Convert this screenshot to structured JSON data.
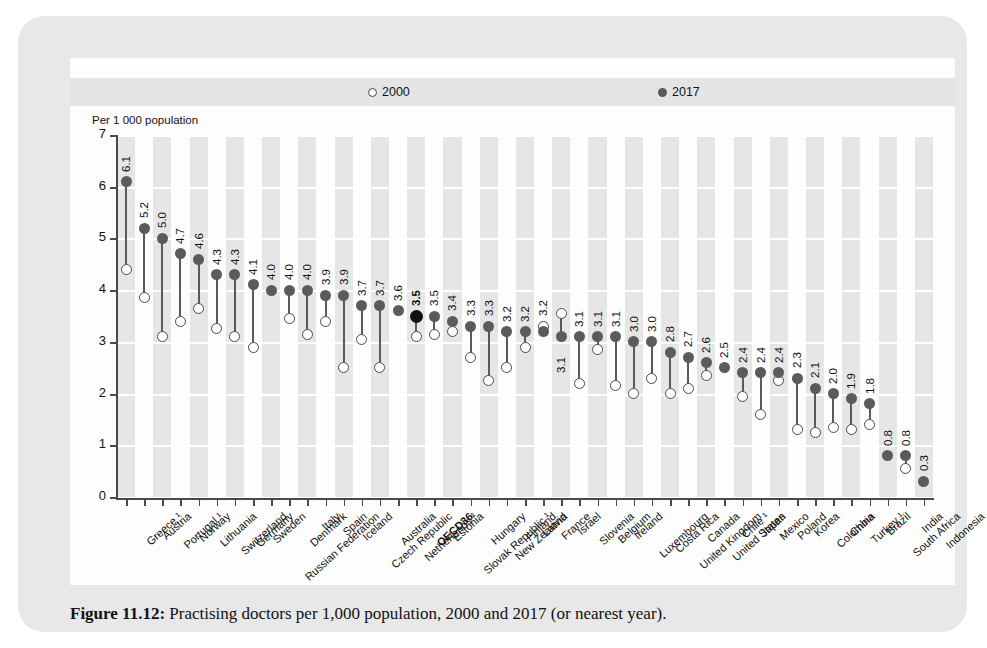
{
  "figure": {
    "caption_label": "Figure 11.12:",
    "caption_text": " Practising doctors per 1,000 population, 2000 and 2017 (or nearest year)."
  },
  "legend": {
    "series_2000": "2000",
    "series_2017": "2017",
    "marker_2000": "open-circle",
    "marker_2017": "filled-circle"
  },
  "axis": {
    "y_title": "Per 1 000 population",
    "y_ticks": [
      "0",
      "1",
      "2",
      "3",
      "4",
      "5",
      "6",
      "7"
    ]
  },
  "colors": {
    "panel": "#e8e8e8",
    "card": "#fdfdfd",
    "band": "#e6e6e6",
    "marker_2017": "#5b5b5b",
    "marker_2017_highlight": "#111111",
    "marker_2000_stroke": "#4a4a4a",
    "axis": "#4a4a4a",
    "gridline": "#ffffff"
  },
  "chart_data": {
    "type": "scatter",
    "title": "Practising doctors per 1,000 population, 2000 and 2017 (or nearest year).",
    "xlabel": "",
    "ylabel": "Per 1 000 population",
    "ylim": [
      0,
      7
    ],
    "grid": true,
    "legend_position": "top",
    "categories": [
      "Greece ¹",
      "Austria",
      "Portugal ¹",
      "Norway",
      "Lithuania",
      "Switzerland",
      "Germany",
      "Sweden",
      "Russian Federation",
      "Denmark",
      "Italy",
      "Spain",
      "Iceland",
      "Czech Republic",
      "Australia",
      "Netherlands ¹",
      "OECD36",
      "Estonia",
      "Slovak Republic ¹",
      "Hungary",
      "New Zealand",
      "Finland",
      "Latvia",
      "France",
      "Israel",
      "Slovenia",
      "Belgium",
      "Ireland",
      "Luxembourg",
      "Costa Rica",
      "United Kingdom",
      "Canada",
      "United States",
      "Chile ¹",
      "Japan",
      "Mexico",
      "Poland",
      "Korea",
      "Colombia",
      "China",
      "Turkey ¹",
      "Brazil",
      "South Africa",
      "India",
      "Indonesia"
    ],
    "series": [
      {
        "name": "2017",
        "marker": "filled-circle",
        "values": [
          6.1,
          5.2,
          5.0,
          4.7,
          4.6,
          4.3,
          4.3,
          4.1,
          4.0,
          4.0,
          4.0,
          3.9,
          3.9,
          3.7,
          3.7,
          3.6,
          3.5,
          3.5,
          3.4,
          3.3,
          3.3,
          3.2,
          3.2,
          3.2,
          3.1,
          3.1,
          3.1,
          3.1,
          3.0,
          3.0,
          2.8,
          2.7,
          2.6,
          2.5,
          2.4,
          2.4,
          2.4,
          2.3,
          2.1,
          2.0,
          1.9,
          1.8,
          0.8,
          0.8,
          0.3
        ],
        "labels": [
          "6.1",
          "5.2",
          "5.0",
          "4.7",
          "4.6",
          "4.3",
          "4.3",
          "4.1",
          "4.0",
          "4.0",
          "4.0",
          "3.9",
          "3.9",
          "3.7",
          "3.7",
          "3.6",
          "3.5",
          "3.5",
          "3.4",
          "3.3",
          "3.3",
          "3.2",
          "3.2",
          "3.2",
          "3.1",
          "3.1",
          "3.1",
          "3.1",
          "3.0",
          "3.0",
          "2.8",
          "2.7",
          "2.6",
          "2.5",
          "2.4",
          "2.4",
          "2.4",
          "2.3",
          "2.1",
          "2.0",
          "1.9",
          "1.8",
          "0.8",
          "0.8",
          "0.3"
        ]
      },
      {
        "name": "2000",
        "marker": "open-circle",
        "values": [
          4.4,
          3.85,
          3.1,
          3.4,
          3.65,
          3.25,
          3.1,
          2.9,
          null,
          3.45,
          3.15,
          3.4,
          2.5,
          3.05,
          2.5,
          null,
          3.1,
          3.15,
          3.2,
          2.7,
          2.25,
          2.5,
          2.9,
          3.3,
          3.55,
          2.2,
          2.85,
          2.15,
          2.0,
          2.3,
          2.0,
          2.1,
          2.35,
          null,
          1.95,
          1.6,
          2.25,
          1.3,
          1.25,
          1.35,
          1.3,
          1.4,
          null,
          0.55,
          null
        ],
        "note": "open circles represent the year 2000; missing where no data point is plotted"
      }
    ],
    "highlight": {
      "category": "OECD36",
      "series": "2017",
      "value": 3.5
    }
  }
}
